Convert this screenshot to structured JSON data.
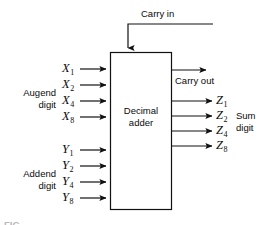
{
  "figure": {
    "block_label_line1": "Decimal",
    "block_label_line2": "adder",
    "caption": "FIG.",
    "colors": {
      "line": "#111111",
      "background": "#ffffff",
      "text": "#0a0a0a"
    }
  },
  "carry": {
    "in_label": "Carry in",
    "out_label": "Carry out"
  },
  "augend": {
    "group_line1": "Augend",
    "group_line2": "digit",
    "signals": [
      {
        "name": "X",
        "sub": "1"
      },
      {
        "name": "X",
        "sub": "2"
      },
      {
        "name": "X",
        "sub": "4"
      },
      {
        "name": "X",
        "sub": "8"
      }
    ]
  },
  "addend": {
    "group_line1": "Addend",
    "group_line2": "digit",
    "signals": [
      {
        "name": "Y",
        "sub": "1"
      },
      {
        "name": "Y",
        "sub": "2"
      },
      {
        "name": "Y",
        "sub": "4"
      },
      {
        "name": "Y",
        "sub": "8"
      }
    ]
  },
  "sum": {
    "group_line1": "Sum",
    "group_line2": "digit",
    "signals": [
      {
        "name": "Z",
        "sub": "1"
      },
      {
        "name": "Z",
        "sub": "2"
      },
      {
        "name": "Z",
        "sub": "4"
      },
      {
        "name": "Z",
        "sub": "8"
      }
    ]
  }
}
